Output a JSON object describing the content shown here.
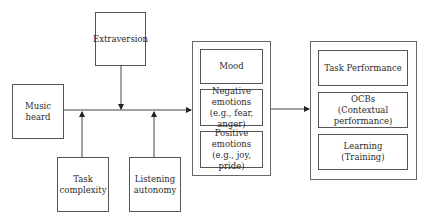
{
  "diagram": {
    "inputs": {
      "music_heard": "Music heard",
      "extraversion": "Extraversion",
      "task_complexity": "Task\ncomplexity",
      "listening_autonomy": "Listening\nautonomy"
    },
    "mediators": [
      {
        "label": "Mood"
      },
      {
        "label": "Negative\nemotions\n(e.g., fear, anger)"
      },
      {
        "label": "Positive\nemotions\n(e.g., joy, pride)"
      }
    ],
    "outcomes": [
      {
        "label": "Task Performance"
      },
      {
        "label": "OCBs\n(Contextual performance)"
      },
      {
        "label": "Learning\n(Training)"
      }
    ],
    "edges": [
      {
        "from": "Music heard",
        "to": "Mediators"
      },
      {
        "from": "Extraversion",
        "to": "Music heard → Mediators path",
        "type": "moderator"
      },
      {
        "from": "Task complexity",
        "to": "Music heard → Mediators path",
        "type": "moderator"
      },
      {
        "from": "Listening autonomy",
        "to": "Music heard → Mediators path",
        "type": "moderator"
      },
      {
        "from": "Mediators",
        "to": "Outcomes"
      }
    ]
  }
}
